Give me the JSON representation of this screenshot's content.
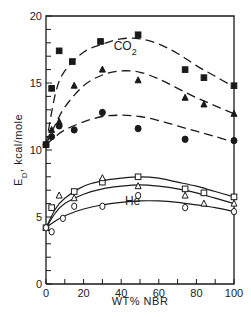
{
  "chart_data": {
    "type": "scatter",
    "title": "",
    "xlabel": "WT% NBR",
    "ylabel": "E_D, kcal/mole",
    "ylabel_main": "E",
    "ylabel_sub": "D",
    "ylabel_unit": ", kcal/mole",
    "xlim": [
      0,
      100
    ],
    "ylim": [
      0,
      20
    ],
    "x_ticks": [
      0,
      20,
      40,
      60,
      80,
      100
    ],
    "y_ticks": [
      0,
      5,
      10,
      15,
      20
    ],
    "x_tick_labels": [
      "0",
      "20",
      "40",
      "60",
      "80",
      "100"
    ],
    "y_tick_labels": [
      "0",
      "5",
      "10",
      "15",
      "20"
    ],
    "grid": false,
    "annotations": [
      {
        "text": "CO",
        "sub": "2",
        "x": 36,
        "y": 17.5
      },
      {
        "text": "He",
        "sub": "",
        "x": 42,
        "y": 5.9
      }
    ],
    "series": [
      {
        "name": "CO2 (filled squares)",
        "gas": "CO2",
        "marker": "filled-square",
        "line": "dashed",
        "x": [
          0,
          3,
          7,
          14,
          29,
          49,
          74,
          84,
          100
        ],
        "y": [
          10.4,
          14.6,
          17.4,
          16.6,
          18.1,
          18.6,
          16.0,
          15.4,
          14.8
        ],
        "curve_x": [
          0,
          5,
          10,
          20,
          30,
          40,
          50,
          60,
          70,
          80,
          90,
          100
        ],
        "curve_y": [
          10.4,
          14.2,
          15.9,
          17.3,
          17.9,
          18.3,
          18.3,
          17.9,
          17.2,
          16.3,
          15.5,
          14.7
        ]
      },
      {
        "name": "CO2 (filled triangles)",
        "gas": "CO2",
        "marker": "filled-triangle",
        "line": "dashed",
        "x": [
          0,
          3,
          7,
          15,
          30,
          49,
          74,
          84,
          100
        ],
        "y": [
          10.4,
          11.5,
          12.1,
          14.8,
          16.0,
          15.2,
          13.9,
          13.4,
          12.7
        ],
        "curve_x": [
          0,
          5,
          10,
          20,
          30,
          40,
          50,
          60,
          70,
          80,
          90,
          100
        ],
        "curve_y": [
          10.4,
          11.9,
          13.2,
          14.8,
          15.6,
          15.9,
          15.8,
          15.3,
          14.6,
          13.9,
          13.3,
          12.7
        ]
      },
      {
        "name": "CO2 (filled circles)",
        "gas": "CO2",
        "marker": "filled-circle",
        "line": "dashed",
        "x": [
          0,
          3,
          7,
          15,
          30,
          49,
          74,
          100
        ],
        "y": [
          10.4,
          11.0,
          11.8,
          11.5,
          12.8,
          11.6,
          10.8,
          10.7
        ],
        "curve_x": [
          0,
          5,
          10,
          20,
          30,
          40,
          50,
          60,
          70,
          80,
          90,
          100
        ],
        "curve_y": [
          10.4,
          11.0,
          11.5,
          12.1,
          12.5,
          12.6,
          12.5,
          12.2,
          11.8,
          11.4,
          11.0,
          10.6
        ]
      },
      {
        "name": "He (open squares)",
        "gas": "He",
        "marker": "open-square",
        "line": "solid",
        "x": [
          0,
          3,
          15,
          30,
          49,
          74,
          84,
          100
        ],
        "y": [
          4.2,
          5.7,
          6.9,
          7.6,
          8.0,
          7.1,
          6.8,
          6.5
        ],
        "curve_x": [
          0,
          5,
          10,
          20,
          30,
          40,
          50,
          60,
          70,
          80,
          90,
          100
        ],
        "curve_y": [
          4.2,
          5.6,
          6.4,
          7.3,
          7.7,
          7.9,
          8.0,
          7.9,
          7.6,
          7.3,
          6.9,
          6.5
        ]
      },
      {
        "name": "He (open triangles)",
        "gas": "He",
        "marker": "open-triangle",
        "line": "solid",
        "x": [
          0,
          7,
          15,
          30,
          49,
          74,
          84,
          100
        ],
        "y": [
          4.2,
          6.6,
          6.4,
          7.9,
          7.3,
          6.6,
          6.0,
          6.0
        ],
        "curve_x": [
          0,
          5,
          10,
          20,
          30,
          40,
          50,
          60,
          70,
          80,
          90,
          100
        ],
        "curve_y": [
          4.2,
          5.3,
          6.0,
          6.7,
          7.1,
          7.3,
          7.4,
          7.3,
          7.1,
          6.8,
          6.4,
          6.0
        ]
      },
      {
        "name": "He (open circles)",
        "gas": "He",
        "marker": "open-circle",
        "line": "solid",
        "x": [
          0,
          3,
          9,
          15,
          30,
          49,
          74,
          100
        ],
        "y": [
          4.2,
          3.9,
          4.9,
          5.8,
          5.8,
          6.6,
          5.7,
          5.4
        ],
        "curve_x": [
          0,
          5,
          10,
          20,
          30,
          40,
          50,
          60,
          70,
          80,
          90,
          100
        ],
        "curve_y": [
          4.2,
          4.7,
          5.1,
          5.6,
          5.9,
          6.1,
          6.2,
          6.2,
          6.1,
          5.9,
          5.7,
          5.4
        ]
      }
    ]
  },
  "layout": {
    "plot_left": 46,
    "plot_right": 234,
    "plot_top": 16,
    "plot_bottom": 284,
    "ink_color": "#1a1a1a"
  }
}
